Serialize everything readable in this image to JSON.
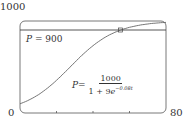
{
  "chart_data": {
    "type": "line",
    "title": "",
    "xlabel": "t",
    "ylabel": "P",
    "xlim": [
      0,
      80
    ],
    "ylim": [
      0,
      1000
    ],
    "tick_labels": {
      "y_top": "1000",
      "y_bottom": "0",
      "x_right": "80"
    },
    "x_ticks": [
      20,
      40,
      60
    ],
    "series": [
      {
        "name": "P = 1000 / (1 + 9e^(-0.08t))",
        "x": [
          0,
          10,
          20,
          30,
          40,
          50,
          60,
          70,
          80
        ],
        "values": [
          100,
          232,
          450,
          690,
          858,
          945,
          980,
          992,
          997
        ]
      },
      {
        "name": "P = 900",
        "x": [
          0,
          80
        ],
        "values": [
          900,
          900
        ]
      }
    ],
    "annotations": [
      {
        "text": "P = 900"
      },
      {
        "text": "P = 1000 / (1 + 9e^(-0.08t))"
      },
      {
        "marker": "intersection",
        "x": 55,
        "y": 900
      }
    ],
    "grid": false,
    "legend": "none"
  },
  "labels": {
    "y_max": "1000",
    "y_min": "0",
    "x_max": "80",
    "line_label_var": "P",
    "line_label_rest": " = 900",
    "formula_var": "P",
    "formula_eq": " =",
    "formula_num": "1000",
    "formula_den": "1 + 9",
    "formula_e": "e",
    "formula_exp": "−0.08t"
  }
}
